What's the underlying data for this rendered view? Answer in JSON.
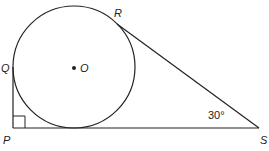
{
  "diagram": {
    "type": "geometry",
    "points": {
      "P": "P",
      "Q": "Q",
      "R": "R",
      "S": "S",
      "O": "O"
    },
    "angle_label": "30°",
    "right_angle_at": "P",
    "colors": {
      "stroke": "#222222",
      "background": "#ffffff"
    }
  }
}
